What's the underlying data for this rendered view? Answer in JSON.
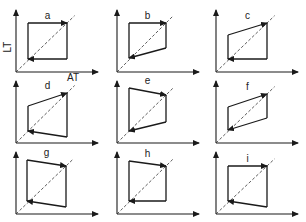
{
  "figure": {
    "y_axis_label": "LT",
    "x_axis_label": "AT",
    "colors": {
      "ink": "#1a1a1a",
      "background": "#ffffff"
    },
    "panels": [
      {
        "label": "a",
        "origin": [
          16,
          72
        ],
        "corners": {
          "tl": [
            28,
            23
          ],
          "tr": [
            67,
            23
          ],
          "br": [
            67,
            59
          ],
          "bl": [
            28,
            59
          ]
        }
      },
      {
        "label": "b",
        "origin": [
          117,
          72
        ],
        "corners": {
          "tl": [
            129,
            23
          ],
          "tr": [
            166,
            23
          ],
          "br": [
            166,
            48
          ],
          "bl": [
            129,
            58
          ]
        }
      },
      {
        "label": "c",
        "origin": [
          216,
          72
        ],
        "corners": {
          "tl": [
            228,
            35
          ],
          "tr": [
            267,
            23
          ],
          "br": [
            267,
            59
          ],
          "bl": [
            228,
            59
          ]
        }
      },
      {
        "label": "d",
        "origin": [
          16,
          143
        ],
        "corners": {
          "tl": [
            28,
            106
          ],
          "tr": [
            67,
            93
          ],
          "br": [
            67,
            137
          ],
          "bl": [
            28,
            131
          ]
        }
      },
      {
        "label": "e",
        "origin": [
          117,
          143
        ],
        "corners": {
          "tl": [
            129,
            88
          ],
          "tr": [
            166,
            95
          ],
          "br": [
            166,
            122
          ],
          "bl": [
            129,
            131
          ]
        }
      },
      {
        "label": "f",
        "origin": [
          216,
          143
        ],
        "corners": {
          "tl": [
            228,
            107
          ],
          "tr": [
            267,
            94
          ],
          "br": [
            267,
            118
          ],
          "bl": [
            228,
            130
          ]
        }
      },
      {
        "label": "g",
        "origin": [
          16,
          214
        ],
        "corners": {
          "tl": [
            27,
            160
          ],
          "tr": [
            66,
            166
          ],
          "br": [
            66,
            207
          ],
          "bl": [
            27,
            201
          ]
        }
      },
      {
        "label": "h",
        "origin": [
          117,
          214
        ],
        "corners": {
          "tl": [
            129,
            161
          ],
          "tr": [
            166,
            166
          ],
          "br": [
            166,
            201
          ],
          "bl": [
            129,
            201
          ]
        }
      },
      {
        "label": "i",
        "origin": [
          216,
          214
        ],
        "corners": {
          "tl": [
            228,
            166
          ],
          "tr": [
            267,
            166
          ],
          "br": [
            267,
            207
          ],
          "bl": [
            228,
            201
          ]
        }
      }
    ]
  }
}
